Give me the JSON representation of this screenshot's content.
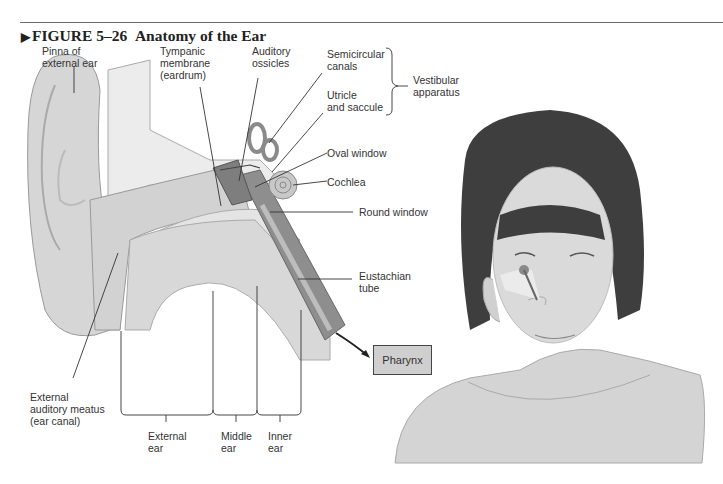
{
  "figure": {
    "number_label": "FIGURE 5–26",
    "title": "Anatomy of the Ear",
    "marker": "▶"
  },
  "labels": {
    "pinna": "Pinna of\nexternal ear",
    "tympanic": "Tympanic\nmembrane\n(eardrum)",
    "ossicles": "Auditory\nossicles",
    "semicircular": "Semicircular\ncanals",
    "utricle": "Utricle\nand saccule",
    "vestibular": "Vestibular\napparatus",
    "oval_window": "Oval window",
    "cochlea": "Cochlea",
    "round_window": "Round window",
    "eustachian": "Eustachian\ntube",
    "pharynx": "Pharynx",
    "meatus": "External\nauditory meatus\n(ear canal)",
    "external_ear": "External\near",
    "middle_ear": "Middle\near",
    "inner_ear": "Inner\near"
  },
  "colors": {
    "line": "#333333",
    "skin": "#d8d8d8",
    "bone": "#ececec",
    "dark": "#8a8a8a",
    "hair": "#3a3a3a",
    "box": "#cfcfcf"
  }
}
